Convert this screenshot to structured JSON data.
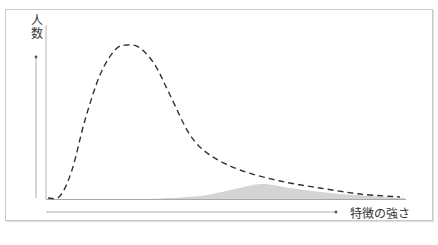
{
  "chart_data": {
    "type": "area",
    "title": "",
    "xlabel": "特徴の強さ",
    "ylabel": "人数",
    "grid": false,
    "legend": null,
    "series": [
      {
        "name": "population-distribution",
        "style": "dashed-line",
        "color": "#333333",
        "points_px": [
          [
            48,
            198
          ],
          [
            60,
            196
          ],
          [
            72,
            170
          ],
          [
            85,
            120
          ],
          [
            100,
            75
          ],
          [
            115,
            50
          ],
          [
            127,
            45
          ],
          [
            140,
            48
          ],
          [
            155,
            65
          ],
          [
            170,
            95
          ],
          [
            190,
            135
          ],
          [
            210,
            155
          ],
          [
            240,
            170
          ],
          [
            280,
            181
          ],
          [
            320,
            188
          ],
          [
            360,
            194
          ],
          [
            400,
            197
          ]
        ]
      },
      {
        "name": "subgroup-distribution",
        "style": "filled-area",
        "color": "#d4d4d4",
        "points_px": [
          [
            150,
            199
          ],
          [
            200,
            196
          ],
          [
            235,
            189
          ],
          [
            262,
            184
          ],
          [
            290,
            188
          ],
          [
            330,
            193
          ],
          [
            370,
            196
          ],
          [
            405,
            198
          ]
        ]
      }
    ],
    "axes": {
      "x_arrow": true,
      "y_arrow": true,
      "tick_labels": []
    }
  },
  "labels": {
    "y_axis": "人数",
    "x_axis": "特徴の強さ"
  },
  "colors": {
    "curve": "#333333",
    "fill": "#d4d4d4",
    "axis": "#999999",
    "frame": "#c9c9c9"
  }
}
